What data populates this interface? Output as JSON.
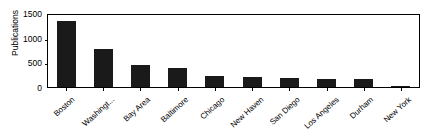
{
  "chart_data": {
    "type": "bar",
    "title": "",
    "xlabel": "",
    "ylabel": "Publications",
    "categories": [
      "Boston",
      "Washingt...",
      "Bay Area",
      "Baltimore",
      "Chicago",
      "New Haven",
      "San Diego",
      "Los Angeles",
      "Durham",
      "New York"
    ],
    "values": [
      1340,
      780,
      455,
      395,
      215,
      205,
      185,
      170,
      160,
      20
    ],
    "ylim": [
      0,
      1500
    ],
    "yticks": [
      0,
      500,
      1000,
      1500
    ],
    "ytick_labels": [
      "0",
      "500",
      "1000",
      "1500"
    ],
    "grid": false,
    "legend": null,
    "bar_color": "#1a1a1a",
    "axis_color": "#000000",
    "background_color": "#ffffff",
    "series": [
      {
        "name": "Publications",
        "values": [
          1340,
          780,
          455,
          395,
          215,
          205,
          185,
          170,
          160,
          20
        ]
      }
    ]
  }
}
